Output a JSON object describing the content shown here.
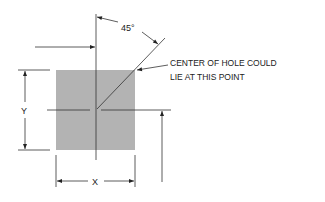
{
  "diagram": {
    "angle_label": "45°",
    "y_label": "Y",
    "x_label": "X",
    "callout": {
      "line1": "CENTER OF HOLE COULD",
      "line2": "LIE AT THIS POINT"
    },
    "colors": {
      "square_fill": "#b3b3b3",
      "line": "#333333",
      "text": "#222222"
    }
  }
}
